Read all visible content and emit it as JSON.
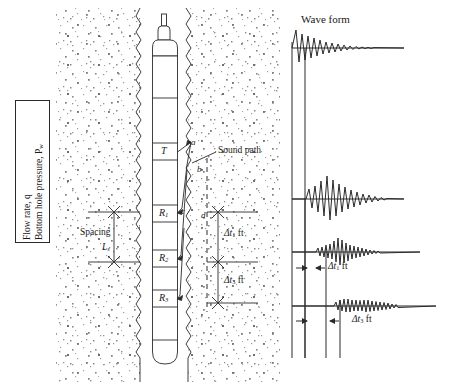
{
  "figure": {
    "type": "acoustic-sonic-logging-tool-schematic",
    "left_panel": {
      "annotation_box": {
        "line1": "Flow rate, q",
        "line2": "Bottom hole pressure, P",
        "line2_sub": "w"
      },
      "spacing": {
        "label": "Spacing",
        "symbol": "L",
        "symbol_sub": "s"
      },
      "sonde_labels": {
        "transmitter": "T",
        "receiver1": "R",
        "receiver1_sub": "1",
        "receiver2": "R",
        "receiver2_sub": "2",
        "receiver3": "R",
        "receiver3_sub": "3"
      },
      "path_points": {
        "a": "a",
        "b": "b",
        "c": "c",
        "d": "d"
      },
      "sound_path_label": "Sound path",
      "interval_labels": {
        "dt1": "Δt",
        "dt1_sub": "1",
        "dt1_unit": "ft",
        "dt3": "Δt",
        "dt3_sub": "3",
        "dt3_unit": "ft"
      }
    },
    "right_panel": {
      "title": "Wave form",
      "trace_labels": {
        "dt1": "Δt",
        "dt1_sub": "1",
        "dt1_unit": "ft",
        "dt3": "Δt",
        "dt3_sub": "3",
        "dt3_unit": "ft"
      }
    },
    "colors": {
      "ink": "#1a1a1a",
      "line": "#2a2a2a",
      "speckle": "#7a7a7a",
      "background": "#ffffff"
    }
  }
}
